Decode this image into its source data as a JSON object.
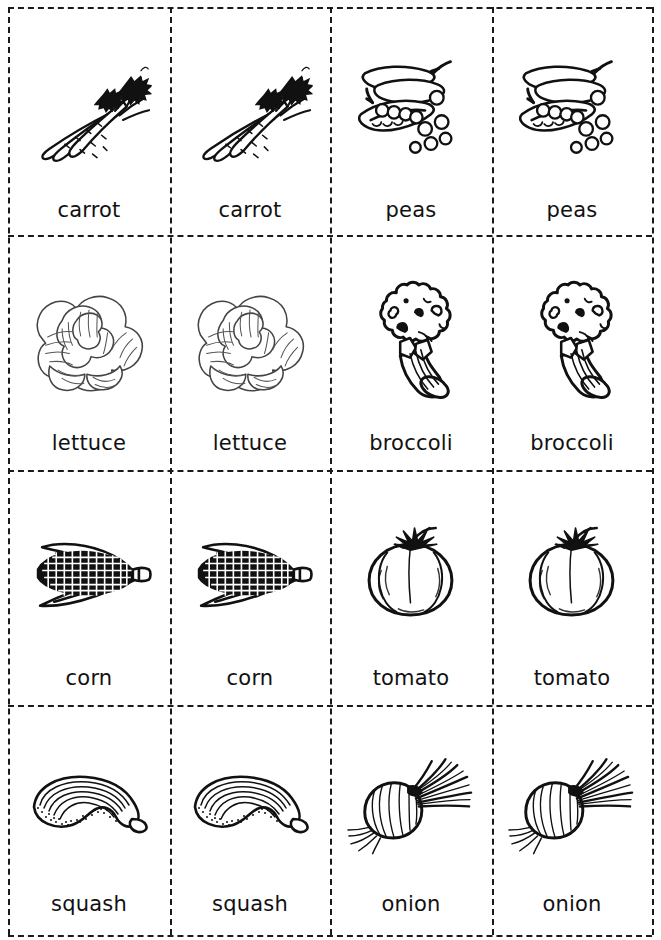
{
  "sheet": {
    "title": "Vegetable Flashcards",
    "background_color": "#ffffff",
    "ink_color": "#111111",
    "cut_line_color": "#1a1a1a",
    "columns": 4,
    "rows": 4
  },
  "cards": [
    {
      "label": "carrot",
      "icon": "carrot-icon",
      "row": 1,
      "column": 1
    },
    {
      "label": "carrot",
      "icon": "carrot-icon",
      "row": 1,
      "column": 2
    },
    {
      "label": "peas",
      "icon": "peas-icon",
      "row": 1,
      "column": 3
    },
    {
      "label": "peas",
      "icon": "peas-icon",
      "row": 1,
      "column": 4
    },
    {
      "label": "lettuce",
      "icon": "lettuce-icon",
      "row": 2,
      "column": 1
    },
    {
      "label": "lettuce",
      "icon": "lettuce-icon",
      "row": 2,
      "column": 2
    },
    {
      "label": "broccoli",
      "icon": "broccoli-icon",
      "row": 2,
      "column": 3
    },
    {
      "label": "broccoli",
      "icon": "broccoli-icon",
      "row": 2,
      "column": 4
    },
    {
      "label": "corn",
      "icon": "corn-icon",
      "row": 3,
      "column": 1
    },
    {
      "label": "corn",
      "icon": "corn-icon",
      "row": 3,
      "column": 2
    },
    {
      "label": "tomato",
      "icon": "tomato-icon",
      "row": 3,
      "column": 3
    },
    {
      "label": "tomato",
      "icon": "tomato-icon",
      "row": 3,
      "column": 4
    },
    {
      "label": "squash",
      "icon": "squash-icon",
      "row": 4,
      "column": 1
    },
    {
      "label": "squash",
      "icon": "squash-icon",
      "row": 4,
      "column": 2
    },
    {
      "label": "onion",
      "icon": "onion-icon",
      "row": 4,
      "column": 3
    },
    {
      "label": "onion",
      "icon": "onion-icon",
      "row": 4,
      "column": 4
    }
  ]
}
